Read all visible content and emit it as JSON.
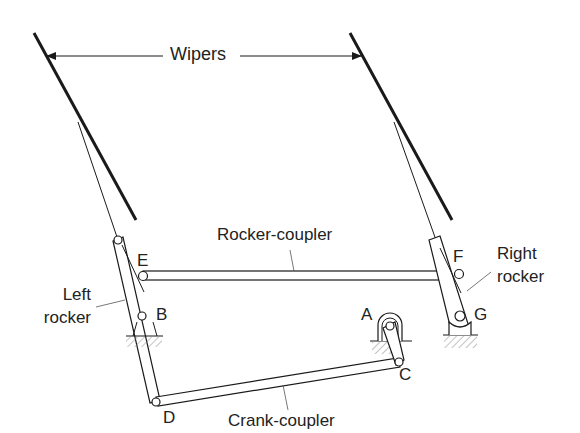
{
  "diagram": {
    "labels": {
      "wipers": "Wipers",
      "rocker_coupler": "Rocker-coupler",
      "crank_coupler": "Crank-coupler",
      "left_rocker_line1": "Left",
      "left_rocker_line2": "rocker",
      "right_rocker_line1": "Right",
      "right_rocker_line2": "rocker",
      "joint_a": "A",
      "joint_b": "B",
      "joint_c": "C",
      "joint_d": "D",
      "joint_e": "E",
      "joint_f": "F",
      "joint_g": "G"
    },
    "colors": {
      "stroke": "#1a1a1a",
      "hatch": "#777777",
      "background": "#ffffff"
    }
  }
}
